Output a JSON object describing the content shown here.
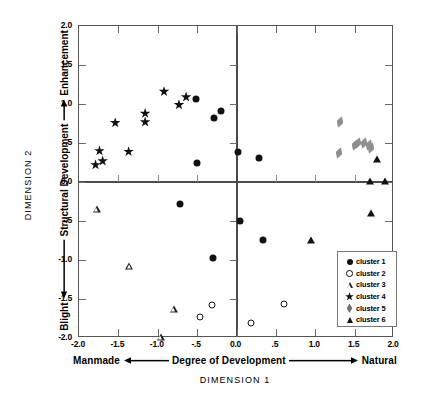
{
  "chart_data": {
    "type": "scatter",
    "title": "",
    "xlabel": "DIMENSION 1",
    "ylabel": "DIMENSION 2",
    "xlim": [
      -2.0,
      2.0
    ],
    "ylim": [
      -2.0,
      2.0
    ],
    "grid": false,
    "legend_position": "bottom-right",
    "x_axis_annotation": {
      "left_label": "Manmade",
      "center_label": "Degree of Development",
      "right_label": "Natural",
      "dimension_label": "DIMENSION 1"
    },
    "y_axis_annotation": {
      "bottom_label": "Blight",
      "center_label": "Structural Development",
      "top_label": "Enhancement",
      "dimension_label": "DIMENSION 2"
    },
    "xticks": [
      "-2.0",
      "-1.5",
      "-1.0",
      "-.5",
      "0.0",
      ".5",
      "1.0",
      "1.5",
      "2.0"
    ],
    "xtick_values": [
      -2.0,
      -1.5,
      -1.0,
      -0.5,
      0.0,
      0.5,
      1.0,
      1.5,
      2.0
    ],
    "yticks": [
      "2.0",
      "1.5",
      "1.0",
      ".5",
      "0.0",
      "-.5",
      "-1.0",
      "-1.5",
      "-2.0"
    ],
    "ytick_values": [
      2.0,
      1.5,
      1.0,
      0.5,
      0.0,
      -0.5,
      -1.0,
      -1.5,
      -2.0
    ],
    "series": [
      {
        "name": "cluster 1",
        "marker": "circle-filled",
        "color": "#111111",
        "points": [
          [
            -0.52,
            1.07
          ],
          [
            -0.28,
            0.82
          ],
          [
            -0.2,
            0.91
          ],
          [
            -0.5,
            0.24
          ],
          [
            0.02,
            0.39
          ],
          [
            0.28,
            0.31
          ],
          [
            -0.72,
            -0.28
          ],
          [
            -0.3,
            -0.97
          ],
          [
            0.34,
            -0.74
          ],
          [
            0.05,
            -0.5
          ]
        ]
      },
      {
        "name": "cluster 2",
        "marker": "circle-open",
        "color": "#111111",
        "points": [
          [
            -0.46,
            -1.73
          ],
          [
            -0.31,
            -1.58
          ],
          [
            0.18,
            -1.81
          ],
          [
            0.6,
            -1.57
          ]
        ]
      },
      {
        "name": "cluster 3",
        "marker": "triangle-open",
        "color": "#222222",
        "points": [
          [
            -1.77,
            -0.35
          ],
          [
            -1.36,
            -0.99
          ],
          [
            -0.79,
            -1.45
          ],
          [
            -0.96,
            -1.72
          ]
        ]
      },
      {
        "name": "cluster 4",
        "marker": "star",
        "color": "#111111",
        "points": [
          [
            -1.79,
            0.22
          ],
          [
            -1.7,
            0.27
          ],
          [
            -1.74,
            0.4
          ],
          [
            -1.54,
            0.76
          ],
          [
            -1.37,
            0.39
          ],
          [
            -1.16,
            0.88
          ],
          [
            -1.16,
            0.77
          ],
          [
            -0.92,
            1.16
          ],
          [
            -0.73,
            0.99
          ],
          [
            -0.64,
            1.09
          ]
        ]
      },
      {
        "name": "cluster 5",
        "marker": "diamond",
        "color": "#8e8e8e",
        "points": [
          [
            1.32,
            0.77
          ],
          [
            1.3,
            0.37
          ],
          [
            1.5,
            0.47
          ],
          [
            1.54,
            0.5
          ],
          [
            1.62,
            0.5
          ],
          [
            1.68,
            0.47
          ],
          [
            1.71,
            0.43
          ]
        ]
      },
      {
        "name": "cluster 6",
        "marker": "triangle-filled",
        "color": "#111111",
        "points": [
          [
            1.78,
            0.29
          ],
          [
            1.7,
            0.01
          ],
          [
            1.88,
            0.01
          ],
          [
            1.71,
            -0.4
          ],
          [
            0.95,
            -0.74
          ]
        ]
      }
    ]
  },
  "legend": {
    "entries": [
      {
        "symbol": "circle-filled",
        "label": "cluster 1"
      },
      {
        "symbol": "circle-open",
        "label": "cluster 2"
      },
      {
        "symbol": "triangle-open",
        "label": "cluster 3"
      },
      {
        "symbol": "star",
        "label": "cluster 4"
      },
      {
        "symbol": "diamond",
        "label": "cluster 5"
      },
      {
        "symbol": "triangle-filled",
        "label": "cluster 6"
      }
    ]
  },
  "colors": {
    "axis": "#4a4a4a",
    "frame": "#555555",
    "marker_dark": "#111111",
    "marker_gray": "#8e8e8e",
    "background": "#ffffff"
  }
}
